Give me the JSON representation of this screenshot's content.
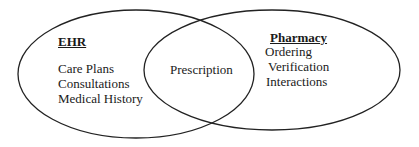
{
  "diagram": {
    "type": "venn",
    "sets": [
      {
        "id": "left",
        "title": "EHR",
        "items": [
          "Care Plans",
          "Consultations",
          "Medical History"
        ]
      },
      {
        "id": "right",
        "title": "Pharmacy",
        "items": [
          "Ordering",
          "Verification",
          "Interactions"
        ]
      }
    ],
    "intersection": {
      "label": "Prescription"
    },
    "colors": {
      "stroke": "#222222",
      "background": "#ffffff",
      "text": "#1a1a1a"
    }
  }
}
